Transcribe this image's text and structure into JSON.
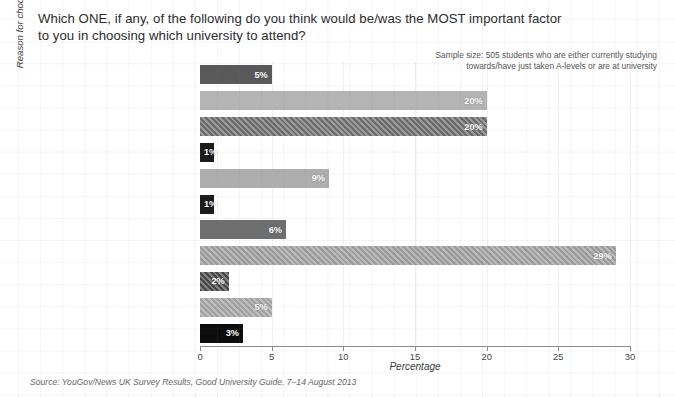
{
  "title": {
    "question": "Which ONE, if any, of the following do you think would be/was the MOST important factor to you in choosing which university to attend?"
  },
  "notes": {
    "sample_size": "Sample size: 505 students who are either currently studying towards/have just taken A-levels or are at university",
    "source": "Source: YouGov/News UK Survey Results, Good University Guide. 7–14 August 2013"
  },
  "axes": {
    "y_title": "Reason for choosing which university to attend",
    "x_title": "Percentage",
    "x_ticks": [
      "0",
      "5",
      "10",
      "15",
      "20",
      "25",
      "30"
    ]
  },
  "chart_data": {
    "type": "bar",
    "orientation": "horizontal",
    "title": "Which ONE, if any, of the following do you think would be/was the MOST important factor to you in choosing which university to attend?",
    "xlabel": "Percentage",
    "ylabel": "Reason for choosing which university to attend",
    "xlim": [
      0,
      30
    ],
    "xticks": [
      0,
      5,
      10,
      15,
      20,
      25,
      30
    ],
    "grid": true,
    "legend": false,
    "categories": [
      "Student satisfaction ratings",
      "Graduate prospects and employability",
      "Overall rating in university guide(s)",
      "Extra-curricular activities (e.g. clubs and associations)",
      "Best campus/open day experience",
      "Where my friends are going",
      "It's close to home",
      "Degree courses on offer",
      "Value for money on tuition fees",
      "Other",
      "Don't know"
    ],
    "values": [
      5,
      20,
      20,
      1,
      9,
      1,
      6,
      29,
      2,
      5,
      3
    ],
    "value_labels": [
      "5%",
      "20%",
      "20%",
      "1%",
      "9%",
      "1%",
      "6%",
      "29%",
      "2%",
      "5%",
      "3%"
    ],
    "bar_colors": [
      "#595959",
      "#b4b4b4",
      "#6a6a6a",
      "#1c1c1c",
      "#aeaeae",
      "#1c1c1c",
      "#6e6e6e",
      "#9a9a9a",
      "#474747",
      "#a0a0a0",
      "#0d0d0d"
    ],
    "bar_patterns": [
      "solid",
      "solid",
      "hatch",
      "solid",
      "solid",
      "solid",
      "solid",
      "hatch",
      "hatch",
      "hatch",
      "solid"
    ],
    "annotation": "Sample size: 505 students who are either currently studying towards/have just taken A-levels or are at university",
    "source": "Source: YouGov/News UK Survey Results, Good University Guide. 7–14 August 2013"
  },
  "colors": {
    "axis": "#8d8d8d",
    "grid": "#e4e6ea",
    "text": "#2f2f2f"
  }
}
